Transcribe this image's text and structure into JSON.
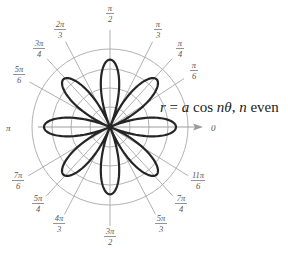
{
  "diagram": {
    "type": "polar-rose",
    "equation": {
      "r": "r",
      "eq": " = ",
      "a": "a",
      "cos": " cos ",
      "ntheta": "nθ",
      "comma": ", ",
      "n": "n",
      "even": " even"
    },
    "center": {
      "x": 110,
      "y": 127
    },
    "grid": {
      "circle_radii": [
        20,
        39,
        58,
        78
      ],
      "color": "#9a9a9a"
    },
    "curve": {
      "petals": 8,
      "n": 4,
      "amplitude_px": 66,
      "color": "#222222"
    },
    "axis_labels": {
      "zero": "0",
      "pi": "π"
    },
    "angle_labels": [
      {
        "id": "pi-over-2",
        "num": "π",
        "den": "2",
        "x": 110,
        "y": 11
      },
      {
        "id": "pi-over-3",
        "num": "π",
        "den": "3",
        "x": 158,
        "y": 27
      },
      {
        "id": "pi-over-4",
        "num": "π",
        "den": "4",
        "x": 180,
        "y": 46
      },
      {
        "id": "pi-over-6",
        "num": "π",
        "den": "6",
        "x": 194,
        "y": 68
      },
      {
        "id": "2pi-over-3",
        "num": "2π",
        "den": "3",
        "x": 60,
        "y": 27
      },
      {
        "id": "3pi-over-4",
        "num": "3π",
        "den": "4",
        "x": 39,
        "y": 46
      },
      {
        "id": "5pi-over-6",
        "num": "5π",
        "den": "6",
        "x": 19,
        "y": 72
      },
      {
        "id": "7pi-over-6",
        "num": "7π",
        "den": "6",
        "x": 18,
        "y": 178
      },
      {
        "id": "5pi-over-4",
        "num": "5π",
        "den": "4",
        "x": 38,
        "y": 201
      },
      {
        "id": "4pi-over-3",
        "num": "4π",
        "den": "3",
        "x": 59,
        "y": 221
      },
      {
        "id": "3pi-over-2",
        "num": "3π",
        "den": "2",
        "x": 110,
        "y": 234
      },
      {
        "id": "5pi-over-3",
        "num": "5π",
        "den": "3",
        "x": 161,
        "y": 221
      },
      {
        "id": "7pi-over-4",
        "num": "7π",
        "den": "4",
        "x": 181,
        "y": 201
      },
      {
        "id": "11pi-over-6",
        "num": "11π",
        "den": "6",
        "x": 198,
        "y": 178
      }
    ]
  }
}
